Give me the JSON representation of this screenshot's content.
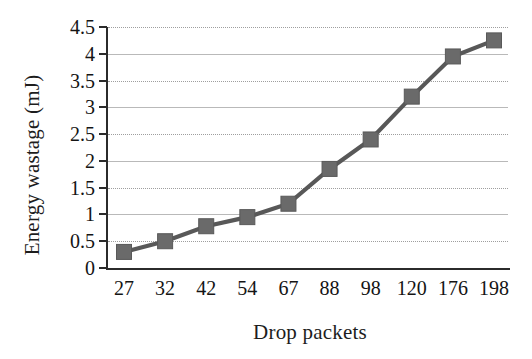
{
  "chart_data": {
    "type": "line",
    "title": "",
    "xlabel": "Drop packets",
    "ylabel": "Energy wastage (mJ)",
    "categories": [
      "27",
      "32",
      "42",
      "54",
      "67",
      "88",
      "98",
      "120",
      "176",
      "198"
    ],
    "values": [
      0.3,
      0.5,
      0.78,
      0.95,
      1.2,
      1.85,
      2.4,
      3.2,
      3.95,
      4.25
    ],
    "series": [
      {
        "name": "Energy wastage",
        "values": [
          0.3,
          0.5,
          0.78,
          0.95,
          1.2,
          1.85,
          2.4,
          3.2,
          3.95,
          4.25
        ]
      }
    ],
    "ylim": [
      0,
      4.5
    ],
    "yticks": [
      "0",
      "0.5",
      "1",
      "1.5",
      "2",
      "2.5",
      "3",
      "3.5",
      "4",
      "4.5"
    ],
    "ytick_values": [
      0,
      0.5,
      1,
      1.5,
      2,
      2.5,
      3,
      3.5,
      4,
      4.5
    ],
    "xtick_labels": [
      "27",
      "32",
      "42",
      "54",
      "67",
      "88",
      "98",
      "120",
      "176",
      "198"
    ],
    "grid": true,
    "grid_axis": "y",
    "legend": false,
    "legend_position": "none",
    "marker": "square",
    "line_color": "#585858",
    "marker_color": "#6a6a6a",
    "grid_color": "#b9b9b9",
    "axis_color": "#2b2b2b",
    "background_color": "#ffffff"
  }
}
